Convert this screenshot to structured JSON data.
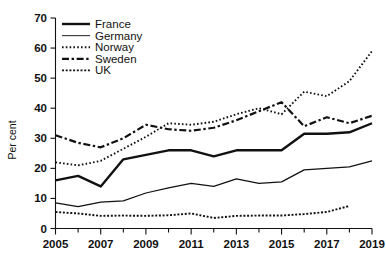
{
  "chart_data": {
    "type": "line",
    "title": "",
    "xlabel": "",
    "ylabel": "Per cent",
    "ylim": [
      0,
      70
    ],
    "ytick_step": 10,
    "yticks": [
      "0",
      "10",
      "20",
      "30",
      "40",
      "50",
      "60",
      "70"
    ],
    "xlim": [
      2005,
      2019
    ],
    "xticks": [
      "2005",
      "2007",
      "2009",
      "2011",
      "2013",
      "2015",
      "2017",
      "2019"
    ],
    "x_minor_ticks": [
      "2006",
      "2008",
      "2010",
      "2012",
      "2014",
      "2016",
      "2018"
    ],
    "grid": false,
    "legend_position": "top-left",
    "x": [
      2005,
      2006,
      2007,
      2008,
      2009,
      2010,
      2011,
      2012,
      2013,
      2014,
      2015,
      2016,
      2017,
      2018,
      2019
    ],
    "series": [
      {
        "name": "France",
        "style": "solid-thick",
        "color": "#111111",
        "values": [
          16.0,
          17.5,
          14.0,
          23.0,
          24.5,
          26.0,
          26.0,
          24.0,
          26.0,
          26.0,
          26.0,
          31.5,
          31.5,
          32.0,
          35.0
        ]
      },
      {
        "name": "Germany",
        "style": "solid-thin",
        "color": "#444444",
        "values": [
          8.5,
          7.3,
          8.8,
          9.2,
          11.8,
          13.5,
          15.0,
          14.0,
          16.5,
          15.0,
          15.5,
          19.5,
          20.0,
          20.5,
          22.5
        ]
      },
      {
        "name": "Norway",
        "style": "dotted",
        "color": "#111111",
        "values": [
          22.0,
          21.0,
          22.5,
          26.5,
          30.5,
          35.0,
          34.5,
          35.5,
          38.0,
          40.0,
          38.0,
          45.5,
          44.0,
          49.0,
          59.0
        ]
      },
      {
        "name": "Sweden",
        "style": "dash-dot",
        "color": "#111111",
        "values": [
          31.0,
          28.5,
          27.0,
          30.0,
          34.5,
          33.0,
          32.5,
          33.5,
          36.0,
          39.0,
          42.0,
          34.0,
          37.0,
          35.0,
          37.5
        ]
      },
      {
        "name": "UK",
        "style": "fine-dotted",
        "color": "#111111",
        "values": [
          5.5,
          5.0,
          4.2,
          4.3,
          4.2,
          4.4,
          5.0,
          3.5,
          4.2,
          4.3,
          4.3,
          4.8,
          5.5,
          7.5,
          null
        ]
      }
    ]
  },
  "legend": {
    "items": [
      {
        "label": "France"
      },
      {
        "label": "Germany"
      },
      {
        "label": "Norway"
      },
      {
        "label": "Sweden"
      },
      {
        "label": "UK"
      }
    ]
  }
}
